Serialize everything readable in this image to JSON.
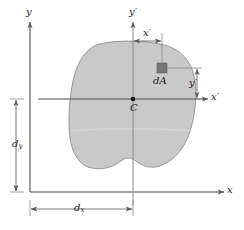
{
  "figure": {
    "type": "engineering-mechanics-diagram",
    "colors": {
      "area_fill": "#c9c9c9",
      "area_stroke": "#8c8c8c",
      "axis_line": "#4d4d4d",
      "dimension_line": "#6e6e6e",
      "label_text": "#1a1a1a",
      "element_square": "#757575",
      "background": "#ffffff"
    },
    "labels": {
      "y_axis": "y",
      "x_axis": "x",
      "y_prime_axis": "y′",
      "x_prime_axis": "x′",
      "centroid": "C",
      "area_element": "dA",
      "x_prime_dim": "x′",
      "y_prime_dim": "y′",
      "dx_dim_base": "d",
      "dx_dim_sub": "x",
      "dy_dim_base": "d",
      "dy_dim_sub": "y"
    },
    "geometry": {
      "origin": {
        "x": 30,
        "y": 192
      },
      "centroid": {
        "x": 133,
        "y": 99
      },
      "element": {
        "x": 157,
        "y": 63,
        "w": 10,
        "h": 10
      },
      "x_prime_value": "x′",
      "y_prime_value": "y′",
      "d_x_value": "d_x",
      "d_y_value": "d_y"
    }
  }
}
